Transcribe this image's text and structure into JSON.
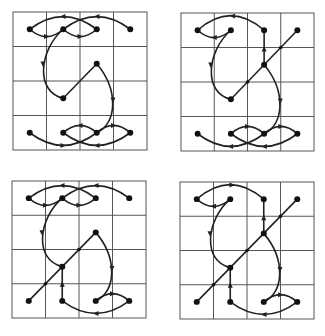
{
  "figure": {
    "grid": {
      "rows": 4,
      "cols": 4
    },
    "colors": {
      "grid": "#555555",
      "edge": "#222222",
      "node": "#111111",
      "background": "#ffffff"
    },
    "panels": [
      {
        "id": "top-left",
        "box": {
          "x": 13,
          "y": 12,
          "w": 134,
          "h": 138
        },
        "nodes": [
          [
            0,
            0
          ],
          [
            1,
            0
          ],
          [
            2,
            0
          ],
          [
            3,
            0
          ],
          [
            1,
            2
          ],
          [
            2,
            1
          ],
          [
            0,
            3
          ],
          [
            1,
            3
          ],
          [
            2,
            3
          ],
          [
            3,
            3
          ]
        ],
        "edges": [
          {
            "d": "M16.75,17.25 Q50,-8 83.75,17.25",
            "arrow": [
              50,
              4.5,
              180
            ]
          },
          {
            "d": "M50.25,17.25 Q84,-8 117.25,17.25",
            "arrow": [
              84,
              4.5,
              180
            ]
          },
          {
            "d": "M16.75,17.25 Q33.5,32 50.25,17.25",
            "arrow": [
              33.5,
              24.5,
              0
            ]
          },
          {
            "d": "M50.25,17.25 Q67,32 83.75,17.25",
            "arrow": [
              67,
              24.5,
              0
            ]
          },
          {
            "d": "M50.25,17.25 C26,38 22,80 50.25,86.25",
            "arrow": [
              30,
              52,
              90
            ]
          },
          {
            "d": "M50.25,86.25 L83.75,51.75",
            "arrow": null
          },
          {
            "d": "M83.75,51.75 C106,78 104,112 83.75,120.75",
            "arrow": [
              100,
              88,
              90
            ]
          },
          {
            "d": "M16.75,120.75 Q50,146 83.75,120.75",
            "arrow": [
              50,
              133.5,
              0
            ]
          },
          {
            "d": "M50.25,120.75 Q84,146 117.25,120.75",
            "arrow": [
              84,
              133.5,
              180
            ]
          },
          {
            "d": "M50.25,120.75 Q67,106 83.75,120.75",
            "arrow": [
              67,
              113.5,
              180
            ]
          },
          {
            "d": "M83.75,120.75 Q100.5,106 117.25,120.75",
            "arrow": [
              100.5,
              113.5,
              0
            ]
          }
        ]
      },
      {
        "id": "top-right",
        "box": {
          "x": 181,
          "y": 13,
          "w": 133,
          "h": 138
        },
        "nodes": [
          [
            0,
            0
          ],
          [
            1,
            0
          ],
          [
            2,
            0
          ],
          [
            3,
            0
          ],
          [
            2,
            1
          ],
          [
            1,
            2
          ],
          [
            0,
            3
          ],
          [
            1,
            3
          ],
          [
            2,
            3
          ],
          [
            3,
            3
          ]
        ],
        "edges": [
          {
            "d": "M16.75,17.25 Q50,-12 83.75,17.25",
            "arrow": [
              52,
              3,
              180
            ]
          },
          {
            "d": "M16.75,17.25 Q33.5,32 50.25,17.25",
            "arrow": [
              33.5,
              24.5,
              180
            ]
          },
          {
            "d": "M50.25,17.25 C26,38 22,80 50.25,86.25",
            "arrow": [
              30,
              52,
              90
            ]
          },
          {
            "d": "M83.75,17.25 L83.75,51.75",
            "arrow": [
              83.75,
              36,
              270
            ]
          },
          {
            "d": "M117.25,17.25 L50.25,86.25",
            "arrow": null
          },
          {
            "d": "M83.75,51.75 C106,78 104,112 83.75,120.75",
            "arrow": [
              100,
              88,
              90
            ]
          },
          {
            "d": "M16.75,120.75 Q50,146 83.75,120.75",
            "arrow": [
              50,
              133.5,
              180
            ]
          },
          {
            "d": "M50.25,120.75 Q84,146 117.25,120.75",
            "arrow": [
              84,
              133.5,
              180
            ]
          },
          {
            "d": "M50.25,120.75 Q67,106 83.75,120.75",
            "arrow": [
              67,
              113.5,
              0
            ]
          },
          {
            "d": "M83.75,120.75 Q100.5,106 117.25,120.75",
            "arrow": [
              100.5,
              113.5,
              0
            ]
          }
        ],
        "mid_dots": [
          [
            100.5,
            34.5
          ],
          [
            67,
            69
          ]
        ]
      },
      {
        "id": "bottom-left",
        "box": {
          "x": 12,
          "y": 181,
          "w": 134,
          "h": 137
        },
        "nodes": [
          [
            0,
            0
          ],
          [
            1,
            0
          ],
          [
            2,
            0
          ],
          [
            3,
            0
          ],
          [
            2,
            1
          ],
          [
            1,
            2
          ],
          [
            0,
            3
          ],
          [
            1,
            3
          ],
          [
            2,
            3
          ],
          [
            3,
            3
          ]
        ],
        "edges": [
          {
            "d": "M16.75,17.25 Q50,-8 83.75,17.25",
            "arrow": [
              50,
              4.5,
              180
            ]
          },
          {
            "d": "M50.25,17.25 Q84,-8 117.25,17.25",
            "arrow": [
              84,
              4.5,
              180
            ]
          },
          {
            "d": "M16.75,17.25 Q33.5,32 50.25,17.25",
            "arrow": [
              33.5,
              24.5,
              0
            ]
          },
          {
            "d": "M50.25,17.25 Q67,32 83.75,17.25",
            "arrow": [
              67,
              24.5,
              0
            ]
          },
          {
            "d": "M50.25,17.25 C26,38 22,80 50.25,86.25",
            "arrow": [
              30,
              52,
              90
            ]
          },
          {
            "d": "M83.75,51.75 L16.75,120.75",
            "arrow": null
          },
          {
            "d": "M50.25,86.25 L50.25,120.75",
            "arrow": [
              50.25,
              104,
              270
            ]
          },
          {
            "d": "M83.75,51.75 C106,78 104,112 83.75,120.75",
            "arrow": [
              100,
              88,
              90
            ]
          },
          {
            "d": "M50.25,120.75 Q84,146 117.25,120.75",
            "arrow": [
              84,
              133.5,
              180
            ]
          },
          {
            "d": "M83.75,120.75 Q100.5,106 117.25,120.75",
            "arrow": [
              100.5,
              113.5,
              0
            ]
          }
        ],
        "mid_dots": [
          [
            67,
            69
          ],
          [
            33.5,
            103.5
          ]
        ]
      },
      {
        "id": "bottom-right",
        "box": {
          "x": 180,
          "y": 182,
          "w": 134,
          "h": 137
        },
        "nodes": [
          [
            0,
            0
          ],
          [
            1,
            0
          ],
          [
            2,
            0
          ],
          [
            3,
            0
          ],
          [
            2,
            1
          ],
          [
            1,
            2
          ],
          [
            0,
            3
          ],
          [
            1,
            3
          ],
          [
            2,
            3
          ],
          [
            3,
            3
          ]
        ],
        "edges": [
          {
            "d": "M16.75,17.25 Q50,-12 83.75,17.25",
            "arrow": [
              52,
              3,
              0
            ]
          },
          {
            "d": "M16.75,17.25 Q33.5,32 50.25,17.25",
            "arrow": [
              33.5,
              24.5,
              180
            ]
          },
          {
            "d": "M50.25,17.25 C26,38 22,80 50.25,86.25",
            "arrow": [
              30,
              52,
              90
            ]
          },
          {
            "d": "M83.75,17.25 L83.75,51.75",
            "arrow": [
              83.75,
              36,
              270
            ]
          },
          {
            "d": "M117.25,17.25 L16.75,120.75",
            "arrow": null
          },
          {
            "d": "M50.25,86.25 L50.25,120.75",
            "arrow": [
              50.25,
              104,
              270
            ]
          },
          {
            "d": "M83.75,51.75 C106,78 104,112 83.75,120.75",
            "arrow": [
              100,
              88,
              90
            ]
          },
          {
            "d": "M50.25,120.75 Q84,146 117.25,120.75",
            "arrow": [
              84,
              133.5,
              180
            ]
          },
          {
            "d": "M83.75,120.75 Q100.5,106 117.25,120.75",
            "arrow": [
              100.5,
              113.5,
              0
            ]
          }
        ],
        "mid_dots": [
          [
            100.5,
            34.5
          ],
          [
            67,
            69
          ],
          [
            33.5,
            103.5
          ]
        ]
      }
    ]
  }
}
